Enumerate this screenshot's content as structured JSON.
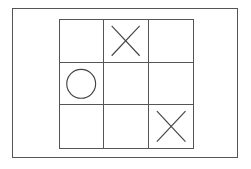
{
  "board": {
    "rows": 3,
    "cols": 3,
    "cells": [
      [
        "",
        "X",
        ""
      ],
      [
        "O",
        "",
        ""
      ],
      [
        "",
        "",
        "X"
      ]
    ]
  },
  "colors": {
    "line": "#555555",
    "mark": "#444444",
    "background": "#ffffff"
  }
}
